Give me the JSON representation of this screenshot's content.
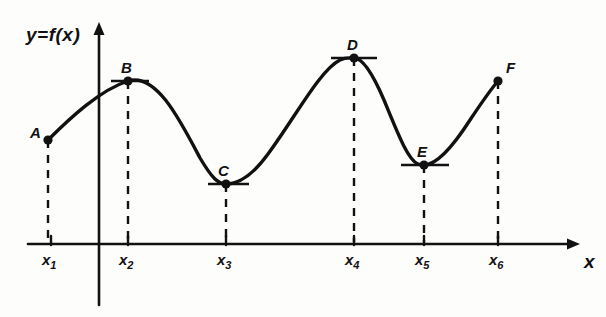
{
  "figure": {
    "background_color": "#fdfdfc",
    "ink_color": "#111111"
  },
  "axes": {
    "y_axis_label": "y=f(x)",
    "x_axis_label": "x",
    "x_axis_y_px": 244,
    "y_axis_x_px": 99,
    "x_axis_start_px": 28,
    "x_axis_arrow_px": 580,
    "y_axis_arrow_px": 22,
    "y_axis_bottom_px": 305
  },
  "ticks": [
    {
      "name": "x1",
      "label": "x",
      "sub": "1",
      "x_px": 51,
      "label_x_px": 42,
      "label_y_px": 251
    },
    {
      "name": "x2",
      "label": "x",
      "sub": "2",
      "x_px": 128,
      "label_x_px": 119,
      "label_y_px": 251
    },
    {
      "name": "x3",
      "label": "x",
      "sub": "3",
      "x_px": 226,
      "label_x_px": 217,
      "label_y_px": 251
    },
    {
      "name": "x4",
      "label": "x",
      "sub": "4",
      "x_px": 354,
      "label_x_px": 345,
      "label_y_px": 251
    },
    {
      "name": "x5",
      "label": "x",
      "sub": "5",
      "x_px": 424,
      "label_x_px": 415,
      "label_y_px": 251
    },
    {
      "name": "x6",
      "label": "x",
      "sub": "6",
      "x_px": 498,
      "label_x_px": 489,
      "label_y_px": 251
    }
  ],
  "points": [
    {
      "name": "A",
      "label": "A",
      "x_px": 48,
      "y_px": 140,
      "label_x_px": 30,
      "label_y_px": 124,
      "tangent": false,
      "kind": "endpoint-left"
    },
    {
      "name": "B",
      "label": "B",
      "x_px": 128,
      "y_px": 81,
      "label_x_px": 121,
      "label_y_px": 59,
      "tangent": true,
      "kind": "local-maximum"
    },
    {
      "name": "C",
      "label": "C",
      "x_px": 226,
      "y_px": 184,
      "label_x_px": 218,
      "label_y_px": 162,
      "tangent": true,
      "kind": "local-minimum"
    },
    {
      "name": "D",
      "label": "D",
      "x_px": 354,
      "y_px": 58,
      "label_x_px": 347,
      "label_y_px": 36,
      "tangent": true,
      "kind": "local-maximum"
    },
    {
      "name": "E",
      "label": "E",
      "x_px": 424,
      "y_px": 165,
      "label_x_px": 417,
      "label_y_px": 143,
      "tangent": true,
      "kind": "local-minimum"
    },
    {
      "name": "F",
      "label": "F",
      "x_px": 498,
      "y_px": 81,
      "label_x_px": 506,
      "label_y_px": 59,
      "tangent": false,
      "kind": "endpoint-right"
    }
  ],
  "tangent_segments": [
    {
      "point": "B",
      "x1_px": 111,
      "x2_px": 149,
      "y_px": 81
    },
    {
      "point": "C",
      "x1_px": 208,
      "x2_px": 249,
      "y_px": 184
    },
    {
      "point": "D",
      "x1_px": 331,
      "x2_px": 377,
      "y_px": 58
    },
    {
      "point": "E",
      "x1_px": 401,
      "x2_px": 449,
      "y_px": 165
    }
  ],
  "drop_lines": [
    {
      "point": "A",
      "x_px": 48,
      "y_top_px": 140,
      "y_bottom_px": 244
    },
    {
      "point": "B",
      "x_px": 128,
      "y_top_px": 81,
      "y_bottom_px": 244
    },
    {
      "point": "C",
      "x_px": 226,
      "y_top_px": 184,
      "y_bottom_px": 244
    },
    {
      "point": "D",
      "x_px": 354,
      "y_top_px": 58,
      "y_bottom_px": 244
    },
    {
      "point": "E",
      "x_px": 424,
      "y_top_px": 165,
      "y_bottom_px": 244
    },
    {
      "point": "F",
      "x_px": 498,
      "y_top_px": 81,
      "y_bottom_px": 244
    }
  ],
  "chart_data": {
    "type": "line",
    "xlabel": "x",
    "ylabel": "y=f(x)",
    "grid": false,
    "legend": null,
    "x_tick_labels": [
      "x1",
      "x2",
      "x3",
      "x4",
      "x5",
      "x6"
    ],
    "y_tick_labels": [],
    "curve_path": "M 48 140 C 70 118, 100 90, 128 81 C 156 72, 180 120, 200 158 C 212 178, 218 184, 226 184 C 238 184, 252 176, 268 154 C 296 116, 320 70, 340 60 C 346 57, 350 58, 354 58 C 362 58, 372 72, 384 100 C 398 134, 408 160, 418 164 C 420 165, 422 165, 424 165 C 436 165, 452 148, 470 120 C 482 102, 492 88, 498 81",
    "marked_points": [
      {
        "label": "A",
        "x": "x1",
        "y_rel": 0.67,
        "tangent_horizontal": false,
        "role": "left endpoint of domain"
      },
      {
        "label": "B",
        "x": "x2",
        "y_rel": 0.87,
        "tangent_horizontal": true,
        "role": "local maximum"
      },
      {
        "label": "C",
        "x": "x3",
        "y_rel": 0.32,
        "tangent_horizontal": true,
        "role": "local minimum"
      },
      {
        "label": "D",
        "x": "x4",
        "y_rel": 1.0,
        "tangent_horizontal": true,
        "role": "absolute maximum"
      },
      {
        "label": "E",
        "x": "x5",
        "y_rel": 0.43,
        "tangent_horizontal": true,
        "role": "local minimum"
      },
      {
        "label": "F",
        "x": "x6",
        "y_rel": 0.87,
        "tangent_horizontal": false,
        "role": "right endpoint of domain"
      }
    ],
    "annotations": [
      "Horizontal tangent segments drawn at B, C, D and E",
      "Dashed vertical drop lines from each marked point to the x-axis",
      "Arrowheads on positive x direction and positive y direction"
    ]
  }
}
